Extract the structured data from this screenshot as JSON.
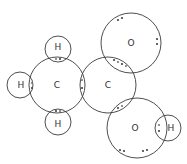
{
  "diagram": {
    "type": "dot-and-cross",
    "molecule": "ethanoic acid",
    "atoms": [
      {
        "id": "C1",
        "label": "C",
        "cx": 57,
        "cy": 85,
        "r": 28
      },
      {
        "id": "C2",
        "label": "C",
        "cx": 108,
        "cy": 85,
        "r": 28
      },
      {
        "id": "H1",
        "label": "H",
        "cx": 58,
        "cy": 49,
        "r": 13
      },
      {
        "id": "H2",
        "label": "H",
        "cx": 20,
        "cy": 85,
        "r": 13
      },
      {
        "id": "H3",
        "label": "H",
        "cx": 58,
        "cy": 122,
        "r": 13
      },
      {
        "id": "O1",
        "label": "O",
        "cx": 131,
        "cy": 43,
        "r": 30
      },
      {
        "id": "O2",
        "label": "O",
        "cx": 137,
        "cy": 128,
        "r": 30
      },
      {
        "id": "H4",
        "label": "H",
        "cx": 168,
        "cy": 128,
        "r": 13
      }
    ],
    "bonds": [
      {
        "from": "C1",
        "to": "H1",
        "type": "single"
      },
      {
        "from": "C1",
        "to": "H2",
        "type": "single"
      },
      {
        "from": "C1",
        "to": "H3",
        "type": "single"
      },
      {
        "from": "C1",
        "to": "C2",
        "type": "single"
      },
      {
        "from": "C2",
        "to": "O1",
        "type": "double"
      },
      {
        "from": "C2",
        "to": "O2",
        "type": "single"
      },
      {
        "from": "O2",
        "to": "H4",
        "type": "single"
      }
    ],
    "lone_pairs": [
      {
        "atom": "O1",
        "count": 2
      },
      {
        "atom": "O2",
        "count": 2
      }
    ]
  }
}
